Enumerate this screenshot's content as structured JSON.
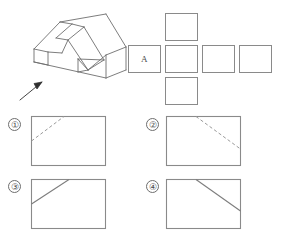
{
  "figure": {
    "stroke_color": "#6e6e6e",
    "text_color": "#4a4a4a",
    "background": "#ffffff"
  },
  "isometric": {
    "caption": "",
    "description": "Isometric view of a rectangular block with a rectangular notch cut in the top-left and an inclined triangular surface on the right front",
    "arrow_label": "",
    "arrow_direction": "up-right"
  },
  "view_layout": {
    "description": "Unfolded six-view arrangement of empty view frames",
    "front_view_label": "A",
    "boxes": [
      {
        "name": "top-view-frame",
        "label": "",
        "row": "top",
        "col": 2
      },
      {
        "name": "left-view-frame",
        "label": "A",
        "row": "middle",
        "col": 1
      },
      {
        "name": "front-view-frame",
        "label": "",
        "row": "middle",
        "col": 2
      },
      {
        "name": "right-view-frame",
        "label": "",
        "row": "middle",
        "col": 3
      },
      {
        "name": "rear-view-frame",
        "label": "",
        "row": "middle",
        "col": 4
      },
      {
        "name": "bottom-view-frame",
        "label": "",
        "row": "bottom",
        "col": 2
      }
    ]
  },
  "options": [
    {
      "id": "1",
      "number_label": "①",
      "line_style": "dashed",
      "line_direction": "ascending-right",
      "from": "left-edge",
      "to": "top-edge"
    },
    {
      "id": "2",
      "number_label": "②",
      "line_style": "dashed",
      "line_direction": "descending-right",
      "from": "top-edge",
      "to": "right-edge"
    },
    {
      "id": "3",
      "number_label": "③",
      "line_style": "solid",
      "line_direction": "ascending-right",
      "from": "left-edge",
      "to": "top-edge"
    },
    {
      "id": "4",
      "number_label": "④",
      "line_style": "solid",
      "line_direction": "descending-right",
      "from": "top-edge",
      "to": "right-edge"
    }
  ]
}
